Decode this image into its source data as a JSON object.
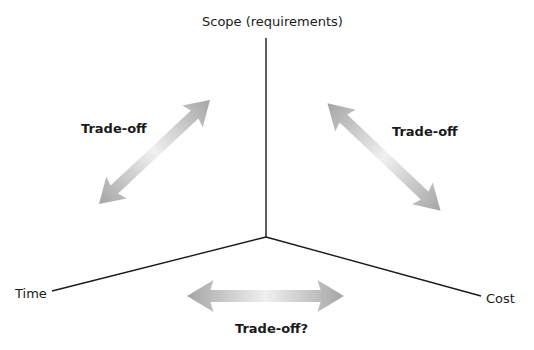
{
  "diagram": {
    "type": "triple-constraint",
    "axes": {
      "scope": {
        "label": "Scope (requirements)"
      },
      "time": {
        "label": "Time"
      },
      "cost": {
        "label": "Cost"
      }
    },
    "tradeoffs": [
      {
        "id": "scope-time",
        "label": "Trade-off",
        "between": [
          "Scope",
          "Time"
        ]
      },
      {
        "id": "scope-cost",
        "label": "Trade-off",
        "between": [
          "Scope",
          "Cost"
        ]
      },
      {
        "id": "time-cost",
        "label": "Trade-off?",
        "between": [
          "Time",
          "Cost"
        ]
      }
    ],
    "colors": {
      "axis_line": "#1a1a1a",
      "arrow_dark": "#a8a8a8",
      "arrow_light": "#f2f2f2",
      "text": "#1a1a1a",
      "background": "#ffffff"
    }
  }
}
